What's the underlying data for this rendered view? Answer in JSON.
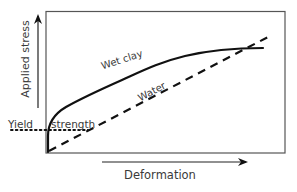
{
  "diagram": {
    "y_axis_label": "Applied stress",
    "x_axis_label": "Deformation",
    "curves": [
      {
        "name": "Wet clay",
        "style": "solid",
        "color": "#111111"
      },
      {
        "name": "Water",
        "style": "dashed",
        "color": "#111111"
      }
    ],
    "curve_labels": {
      "wet_clay": "Wet clay",
      "water": "Water"
    },
    "annotation": {
      "yield_word": "Yield",
      "strength_word": "strength",
      "style": "dotted"
    },
    "colors": {
      "frame": "#555555",
      "axis": "#222222",
      "text": "#3a3a3a"
    }
  }
}
